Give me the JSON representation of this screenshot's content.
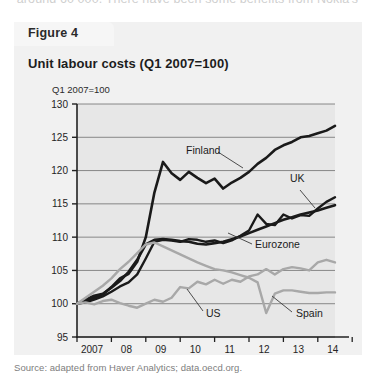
{
  "page": {
    "cut_off_header_text": "around 60 000. There have been some benefits from Nokia's"
  },
  "figure": {
    "tab_label": "Figure 4",
    "title": "Unit labour costs (Q1 2007=100)",
    "source": "Source: adapted from Haver Analytics; data.oecd.org."
  },
  "chart_data": {
    "type": "line",
    "title": "Unit labour costs (Q1 2007=100)",
    "xlabel": "",
    "ylabel": "Q1 2007=100",
    "ylim": [
      95,
      130
    ],
    "yticks": [
      95,
      100,
      105,
      110,
      115,
      120,
      125,
      130
    ],
    "xticks": [
      "2007",
      "08",
      "09",
      "10",
      "11",
      "12",
      "13",
      "14"
    ],
    "xlim": [
      2007,
      2014.5
    ],
    "grid": true,
    "legend_position": "inline-annotations",
    "x": [
      2007.0,
      2007.25,
      2007.5,
      2007.75,
      2008.0,
      2008.25,
      2008.5,
      2008.75,
      2009.0,
      2009.25,
      2009.5,
      2009.75,
      2010.0,
      2010.25,
      2010.5,
      2010.75,
      2011.0,
      2011.25,
      2011.5,
      2011.75,
      2012.0,
      2012.25,
      2012.5,
      2012.75,
      2013.0,
      2013.25,
      2013.5,
      2013.75,
      2014.0,
      2014.25,
      2014.5
    ],
    "series": [
      {
        "name": "Finland",
        "color": "#1a1a1a",
        "width": 2.6,
        "values": [
          100.0,
          100.4,
          100.9,
          101.4,
          102.5,
          103.8,
          104.5,
          106.3,
          110.0,
          116.7,
          121.3,
          119.6,
          118.6,
          119.8,
          118.9,
          118.1,
          118.8,
          117.3,
          118.2,
          118.9,
          119.8,
          121.0,
          121.9,
          123.1,
          123.8,
          124.3,
          125.0,
          125.2,
          125.6,
          126.0,
          126.7
        ]
      },
      {
        "name": "UK",
        "color": "#1a1a1a",
        "width": 2.4,
        "values": [
          100.0,
          100.2,
          100.6,
          101.1,
          101.8,
          102.6,
          103.2,
          104.4,
          106.8,
          109.3,
          109.6,
          109.5,
          109.3,
          109.7,
          109.6,
          109.3,
          109.5,
          109.1,
          109.5,
          110.2,
          111.0,
          113.4,
          112.0,
          111.8,
          113.4,
          112.8,
          113.3,
          113.2,
          114.3,
          115.3,
          116.0
        ]
      },
      {
        "name": "Eurozone",
        "color": "#1a1a1a",
        "width": 2.6,
        "values": [
          100.0,
          100.6,
          101.2,
          101.5,
          102.4,
          103.4,
          104.8,
          106.6,
          108.9,
          109.6,
          109.7,
          109.6,
          109.4,
          109.3,
          109.0,
          108.9,
          109.1,
          109.3,
          109.7,
          110.1,
          110.6,
          111.1,
          111.6,
          112.1,
          112.6,
          113.0,
          113.4,
          113.7,
          114.0,
          114.4,
          114.8
        ]
      },
      {
        "name": "US",
        "color": "#a8a8a8",
        "width": 2.4,
        "values": [
          100.0,
          100.2,
          99.9,
          100.4,
          100.6,
          100.1,
          99.7,
          99.4,
          100.0,
          100.6,
          100.3,
          100.9,
          102.5,
          102.3,
          103.3,
          102.9,
          103.6,
          103.0,
          103.6,
          103.3,
          104.1,
          104.4,
          105.2,
          104.4,
          105.2,
          105.5,
          105.3,
          105.0,
          106.2,
          106.6,
          106.2
        ]
      },
      {
        "name": "Spain",
        "color": "#a8a8a8",
        "width": 2.4,
        "values": [
          100.0,
          100.9,
          101.8,
          102.7,
          103.8,
          105.2,
          106.3,
          107.6,
          108.9,
          109.2,
          108.6,
          108.0,
          107.4,
          106.8,
          106.2,
          105.7,
          105.2,
          105.0,
          104.7,
          104.3,
          103.9,
          103.2,
          98.6,
          101.5,
          102.0,
          102.0,
          101.8,
          101.6,
          101.6,
          101.7,
          101.7
        ]
      }
    ],
    "annotations": [
      {
        "text": "Finland",
        "x_px": 186,
        "y_px": 154
      },
      {
        "text": "UK",
        "x_px": 290,
        "y_px": 182
      },
      {
        "text": "Eurozone",
        "x_px": 255,
        "y_px": 248
      },
      {
        "text": "US",
        "x_px": 206,
        "y_px": 317
      },
      {
        "text": "Spain",
        "x_px": 296,
        "y_px": 317
      }
    ]
  }
}
